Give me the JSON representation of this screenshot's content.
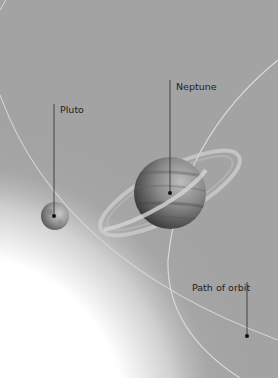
{
  "diagram": {
    "labels": {
      "pluto": "Pluto",
      "neptune": "Neptune",
      "orbit": "Path of orbit"
    },
    "colors": {
      "background": "#a3a3a3",
      "glow": "#ffffff",
      "orbit_line": "#d8d8d8",
      "leader_line": "#2a2a2a",
      "text": "#1e1e1e"
    }
  }
}
